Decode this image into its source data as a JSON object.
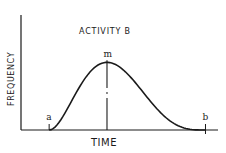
{
  "chart_data": {
    "type": "line",
    "title": "ACTIVITY B",
    "xlabel": "TIME",
    "ylabel": "FREQUENCY",
    "grid": false,
    "legend": "none",
    "xlim": [
      -0.18,
      1.08
    ],
    "ylim": [
      0,
      1.7
    ],
    "curve": {
      "name": "activity-time distribution",
      "shape": "right-skewed unimodal (beta-like)",
      "alpha": 2.0,
      "beta": 3.4,
      "x_start": 0,
      "x_end": 1,
      "peak_value": 1.0
    },
    "markers": [
      {
        "label": "a",
        "x": 0,
        "meaning": "optimistic time",
        "tick": true
      },
      {
        "label": "m",
        "x": 0.37,
        "meaning": "most likely time",
        "tick": true,
        "vertical_line": true
      },
      {
        "label": "b",
        "x": 1,
        "meaning": "pessimistic time",
        "tick": true
      }
    ]
  }
}
